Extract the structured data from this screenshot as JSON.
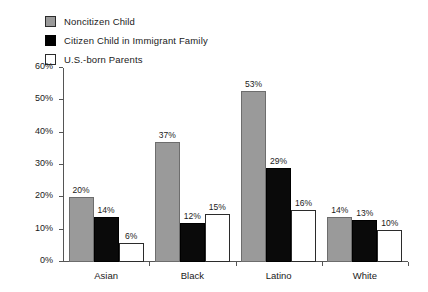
{
  "chart_data": {
    "type": "bar",
    "title": "",
    "subtitle": "",
    "xlabel": "",
    "ylabel": "",
    "ylim": [
      0,
      60
    ],
    "y_ticks": [
      "0%",
      "10%",
      "20%",
      "30%",
      "40%",
      "50%",
      "60%"
    ],
    "y_tick_values": [
      0,
      10,
      20,
      30,
      40,
      50,
      60
    ],
    "grid": false,
    "legend_position": "top-left",
    "value_label_suffix": "%",
    "categories": [
      "Asian",
      "Black",
      "Latino",
      "White"
    ],
    "series": [
      {
        "name": "Noncitizen Child",
        "color": "#9a9a9a",
        "values": [
          20,
          37,
          53,
          14
        ],
        "labels": [
          "20%",
          "37%",
          "53%",
          "14%"
        ]
      },
      {
        "name": "Citizen Child in Immigrant Family",
        "color": "#0a0a0a",
        "values": [
          14,
          12,
          29,
          13
        ],
        "labels": [
          "14%",
          "12%",
          "29%",
          "13%"
        ]
      },
      {
        "name": "U.S.-born Parents",
        "color": "#ffffff",
        "values": [
          6,
          15,
          16,
          10
        ],
        "labels": [
          "6%",
          "15%",
          "16%",
          "10%"
        ]
      }
    ]
  },
  "legend": {
    "items": [
      {
        "label": "Noncitizen Child",
        "swatch": "legend-swatch-gray"
      },
      {
        "label": "Citizen Child in Immigrant Family",
        "swatch": "legend-swatch-black"
      },
      {
        "label": "U.S.-born Parents",
        "swatch": "legend-swatch-white"
      }
    ]
  },
  "axis": {
    "y_labels": [
      "60%",
      "50%",
      "40%",
      "30%",
      "20%",
      "10%",
      "0%"
    ]
  }
}
